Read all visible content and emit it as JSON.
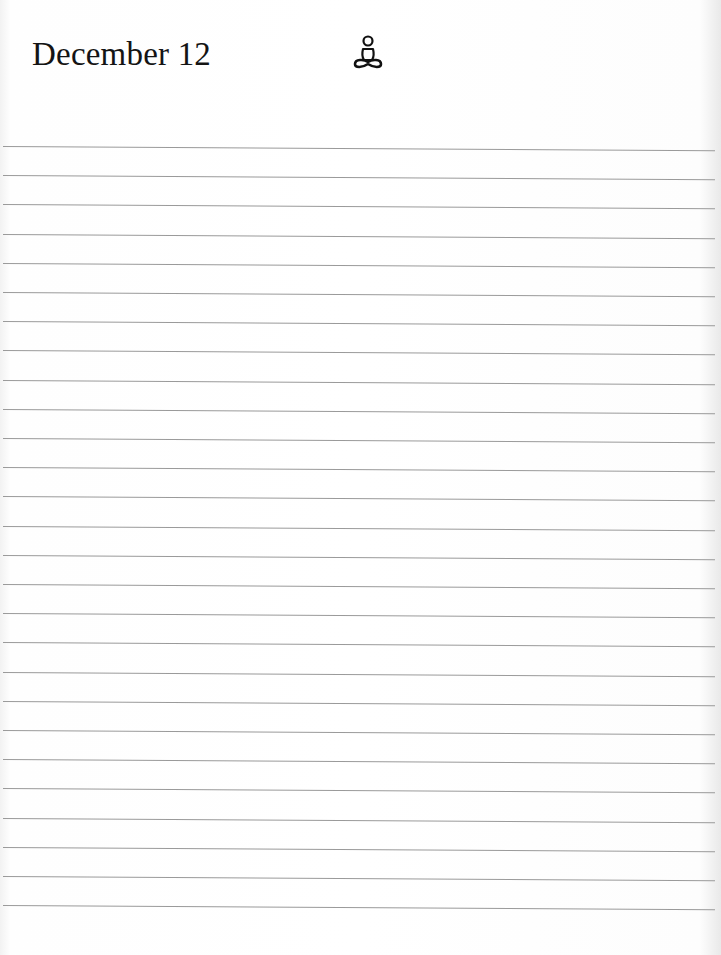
{
  "page": {
    "title": "December 12",
    "icon": "meditation-figure-icon",
    "ruled_lines": {
      "count": 27,
      "first_top": 146,
      "spacing": 29.2,
      "color": "#9a9a9a"
    }
  }
}
